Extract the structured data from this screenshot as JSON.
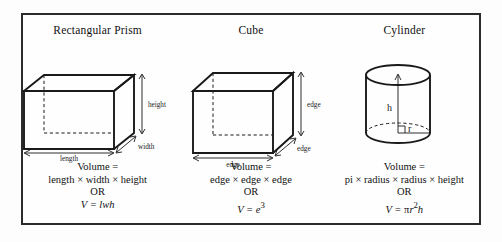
{
  "poster": {
    "border_color": "#2b2b2b",
    "background": "#fefefe",
    "ink_color": "#1a1a1a"
  },
  "columns": [
    {
      "id": "rectangular-prism",
      "title": "Rectangular Prism",
      "shape": "rectangular-prism",
      "dimension_labels": {
        "height": "height",
        "width": "width",
        "length": "length"
      },
      "formula": {
        "line1": "Volume =",
        "line2": "length × width × height",
        "line3": "OR",
        "line4_prefix": "V = ",
        "line4_expr": "lwh"
      }
    },
    {
      "id": "cube",
      "title": "Cube",
      "shape": "cube",
      "dimension_labels": {
        "edge_vertical": "edge",
        "edge_depth": "edge",
        "edge_bottom": "edge"
      },
      "formula": {
        "line1": "Volume =",
        "line2": "edge × edge × edge",
        "line3": "OR",
        "line4_prefix": "V = ",
        "line4_expr": "e",
        "line4_sup": "3"
      }
    },
    {
      "id": "cylinder",
      "title": "Cylinder",
      "shape": "cylinder",
      "dimension_labels": {
        "height": "h",
        "radius": "r"
      },
      "formula": {
        "line1": "Volume =",
        "line2": "pi × radius × radius × height",
        "line3": "OR",
        "line4_prefix": "V = ",
        "line4_pi": "π",
        "line4_r": "r",
        "line4_sup": "2",
        "line4_h": "h"
      }
    }
  ]
}
